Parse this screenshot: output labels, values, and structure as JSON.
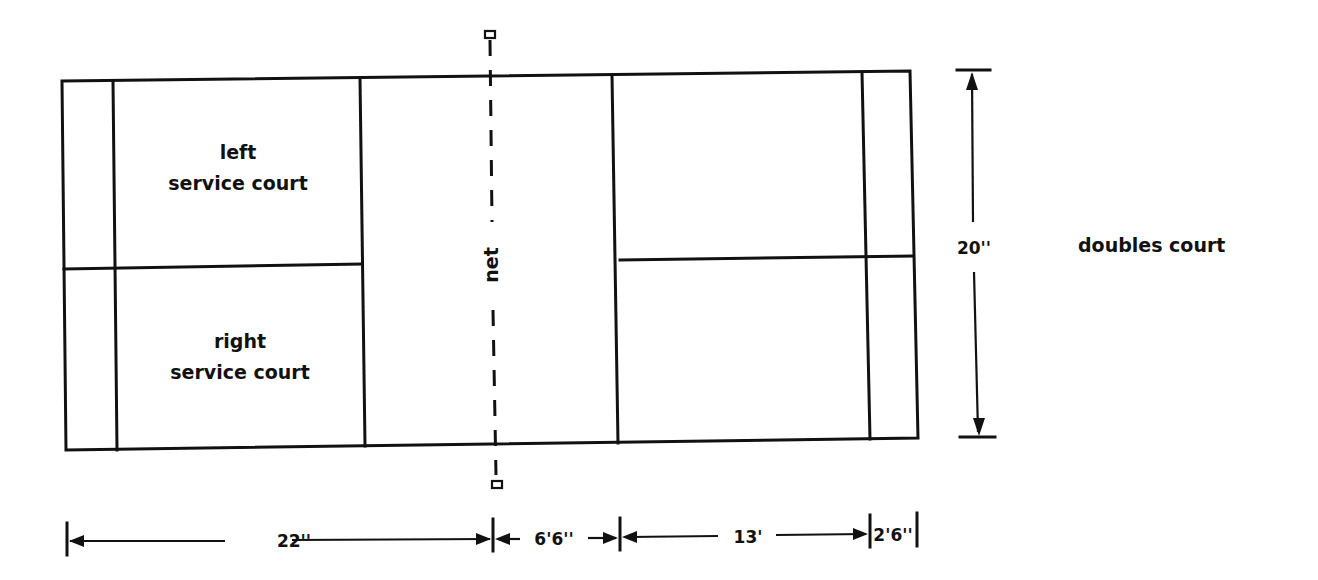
{
  "diagram": {
    "title": "doubles court",
    "stroke_color": "#111111",
    "background": "#ffffff",
    "court_areas": {
      "left_service_court": {
        "line1": "left",
        "line2": "service court"
      },
      "right_service_court": {
        "line1": "right",
        "line2": "service court"
      }
    },
    "net_label": "net",
    "dimensions": {
      "width": "20''",
      "back_to_net": "22''",
      "net_to_short_service": "6'6''",
      "short_service_to_long_service": "13'",
      "long_service_to_back": "2'6''"
    }
  }
}
